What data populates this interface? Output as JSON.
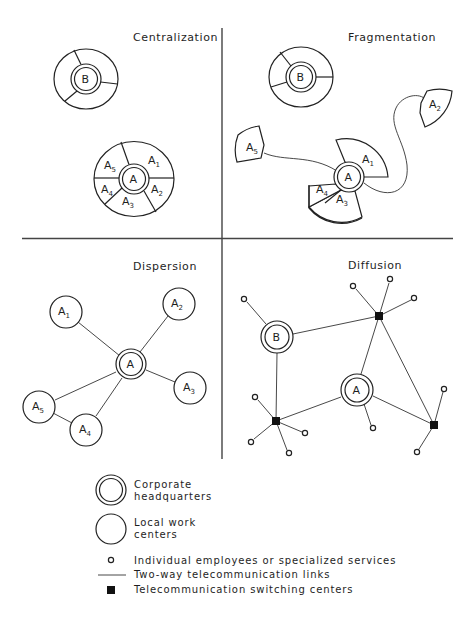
{
  "panels": {
    "centralization": {
      "title": "Centralization",
      "hq_b": {
        "label": "B"
      },
      "hq_a": {
        "label": "A",
        "segments": [
          {
            "label": "A",
            "sub": "1"
          },
          {
            "label": "A",
            "sub": "2"
          },
          {
            "label": "A",
            "sub": "3"
          },
          {
            "label": "A",
            "sub": "4"
          },
          {
            "label": "A",
            "sub": "5"
          }
        ]
      }
    },
    "fragmentation": {
      "title": "Fragmentation",
      "hq_b": {
        "label": "B"
      },
      "hq_a": {
        "label": "A"
      },
      "fragments": [
        {
          "label": "A",
          "sub": "1"
        },
        {
          "label": "A",
          "sub": "2"
        },
        {
          "label": "A",
          "sub": "3"
        },
        {
          "label": "A",
          "sub": "4"
        },
        {
          "label": "A",
          "sub": "5"
        }
      ]
    },
    "dispersion": {
      "title": "Dispersion",
      "hq": {
        "label": "A"
      },
      "centers": [
        {
          "label": "A",
          "sub": "1"
        },
        {
          "label": "A",
          "sub": "2"
        },
        {
          "label": "A",
          "sub": "3"
        },
        {
          "label": "A",
          "sub": "4"
        },
        {
          "label": "A",
          "sub": "5"
        }
      ]
    },
    "diffusion": {
      "title": "Diffusion",
      "hq_a": {
        "label": "A"
      },
      "hq_b": {
        "label": "B"
      }
    }
  },
  "legend": {
    "items": [
      {
        "symbol": "double-circle",
        "line1": "Corporate",
        "line2": "headquarters"
      },
      {
        "symbol": "circle",
        "line1": "Local work",
        "line2": "centers"
      },
      {
        "symbol": "small-circle",
        "line1": "Individual employees or specialized services"
      },
      {
        "symbol": "line",
        "line1": "Two-way telecommunication links"
      },
      {
        "symbol": "filled-square",
        "line1": "Telecommunication switching centers"
      }
    ]
  }
}
